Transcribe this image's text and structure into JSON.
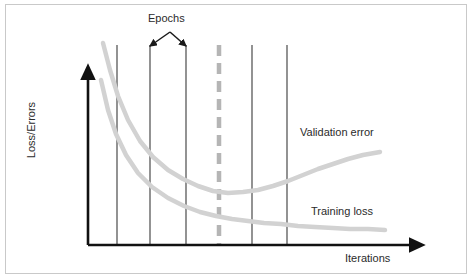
{
  "figure": {
    "title_text": "",
    "border_color": "#c9c9c9",
    "background": "#ffffff"
  },
  "axes": {
    "y_label": "Loss/Errors",
    "x_label": "Iterations",
    "axis_color": "#111111",
    "origin": {
      "x": 88,
      "y": 245
    },
    "y_top": {
      "x": 88,
      "y": 77
    },
    "x_right": {
      "x": 412,
      "y": 245
    }
  },
  "annotations": {
    "epochs_label": "Epochs",
    "epochs_arrow_apex": {
      "x": 170,
      "y": 32
    },
    "epochs_arrow_left_target": {
      "x": 150,
      "y": 46
    },
    "epochs_arrow_right_target": {
      "x": 186,
      "y": 46
    },
    "validation_label": "Validation error",
    "training_label": "Training loss"
  },
  "epoch_lines": {
    "color": "#4a4a4a",
    "width": 1.2,
    "y_top": 45,
    "y_bottom": 245,
    "x_positions": [
      117,
      150,
      186,
      252,
      287
    ]
  },
  "stop_line": {
    "name": "early-stopping-line",
    "color": "#b5b5b5",
    "width": 4.5,
    "dash": "11 7",
    "x": 219,
    "y_top": 45,
    "y_bottom": 245
  },
  "chart_data": {
    "type": "line",
    "title": "",
    "xlabel": "Iterations",
    "ylabel": "Loss/Errors",
    "xlim": [
      88,
      412
    ],
    "ylim": [
      245,
      40
    ],
    "grid": false,
    "legend": "inline-labels",
    "curve_color": "#d2d2d2",
    "curve_width": 4.5,
    "series": [
      {
        "name": "Validation error",
        "label": "Validation error",
        "points": [
          [
            103,
            43
          ],
          [
            110,
            70
          ],
          [
            118,
            96
          ],
          [
            128,
            120
          ],
          [
            140,
            141
          ],
          [
            153,
            157
          ],
          [
            168,
            170
          ],
          [
            183,
            179
          ],
          [
            198,
            186
          ],
          [
            213,
            191
          ],
          [
            228,
            193
          ],
          [
            243,
            192
          ],
          [
            258,
            190
          ],
          [
            273,
            186
          ],
          [
            288,
            181
          ],
          [
            303,
            175
          ],
          [
            318,
            169
          ],
          [
            333,
            164
          ],
          [
            348,
            159
          ],
          [
            363,
            155
          ],
          [
            380,
            152
          ]
        ]
      },
      {
        "name": "Training loss",
        "label": "Training loss",
        "points": [
          [
            101,
            80
          ],
          [
            108,
            110
          ],
          [
            116,
            134
          ],
          [
            126,
            155
          ],
          [
            138,
            173
          ],
          [
            152,
            187
          ],
          [
            168,
            198
          ],
          [
            184,
            206
          ],
          [
            200,
            212
          ],
          [
            216,
            216
          ],
          [
            232,
            219
          ],
          [
            248,
            221
          ],
          [
            264,
            223
          ],
          [
            281,
            224
          ],
          [
            298,
            226
          ],
          [
            315,
            227
          ],
          [
            333,
            228
          ],
          [
            350,
            229
          ],
          [
            368,
            229
          ],
          [
            385,
            230
          ]
        ]
      }
    ]
  }
}
